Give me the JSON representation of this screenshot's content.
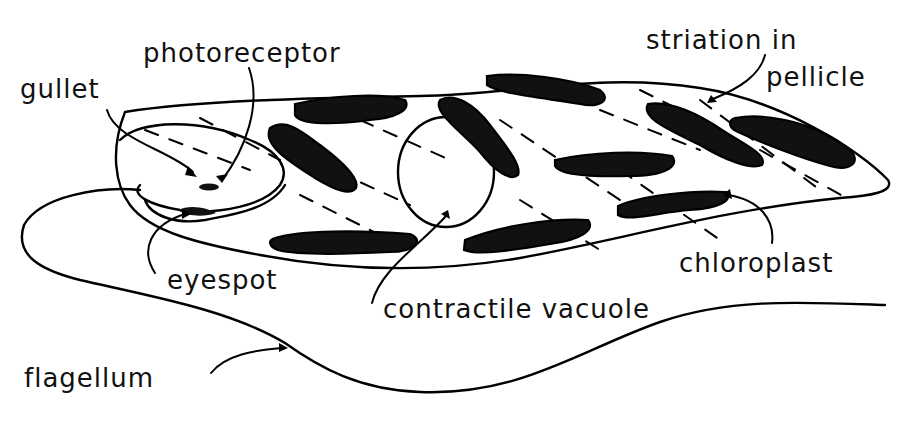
{
  "diagram": {
    "labels": {
      "photoreceptor": "photoreceptor",
      "gullet": "gullet",
      "striation_line1": "striation in",
      "striation_line2": "pellicle",
      "eyespot": "eyespot",
      "chloroplast": "chloroplast",
      "contractile_vacuole": "contractile vacuole",
      "flagellum": "flagellum"
    },
    "colors": {
      "ink": "#000000",
      "background": "#ffffff"
    }
  }
}
